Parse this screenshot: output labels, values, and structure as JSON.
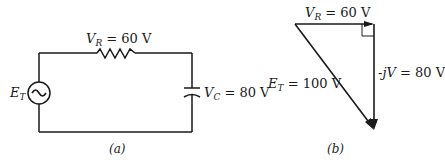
{
  "figure_a": {
    "caption": "(a)",
    "resistor_label": {
      "var": "V",
      "sub": "R",
      "value": "= 60 V"
    },
    "capacitor_label": {
      "var": "V",
      "sub": "C",
      "value": "= 80 V"
    },
    "source_label": {
      "var": "E",
      "sub": "T"
    },
    "source_icon": "ac-source-icon"
  },
  "figure_b": {
    "caption": "(b)",
    "horizontal_label": {
      "var": "V",
      "sub": "R",
      "value": "= 60 V"
    },
    "vertical_label": {
      "prefix": "-j",
      "var": "V",
      "value": "= 80 V"
    },
    "hypotenuse_label": {
      "var": "E",
      "sub": "T",
      "value": "= 100 V"
    }
  },
  "colors": {
    "stroke": "#1a1a1a",
    "background": "#ffffff"
  }
}
